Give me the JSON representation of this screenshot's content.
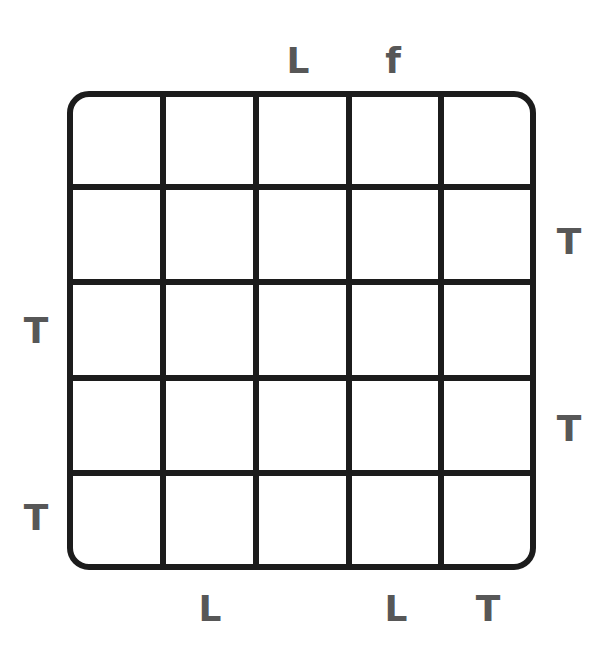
{
  "puzzle": {
    "rows": 5,
    "cols": 5,
    "line_color": "#1c1c1c",
    "clue_color": "#575757",
    "clues": {
      "top": [
        "",
        "",
        "L",
        "f",
        ""
      ],
      "bottom": [
        "",
        "L",
        "",
        "L",
        "T"
      ],
      "left": [
        "",
        "",
        "T",
        "",
        "T"
      ],
      "right": [
        "",
        "T",
        "",
        "T",
        ""
      ]
    },
    "cells": [
      [
        "",
        "",
        "",
        "",
        ""
      ],
      [
        "",
        "",
        "",
        "",
        ""
      ],
      [
        "",
        "",
        "",
        "",
        ""
      ],
      [
        "",
        "",
        "",
        "",
        ""
      ],
      [
        "",
        "",
        "",
        "",
        ""
      ]
    ]
  }
}
